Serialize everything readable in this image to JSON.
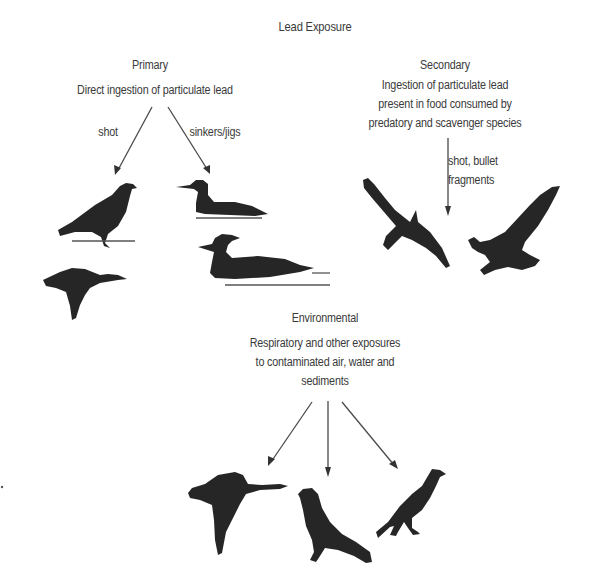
{
  "diagram": {
    "title": "Lead Exposure",
    "primary": {
      "heading": "Primary",
      "description": "Direct ingestion of particulate lead",
      "branches": [
        {
          "label": "shot"
        },
        {
          "label": "sinkers/jigs"
        }
      ],
      "birds": [
        "pigeon-standing",
        "duck-flying",
        "loon-swimming",
        "merganser-swimming"
      ]
    },
    "secondary": {
      "heading": "Secondary",
      "description_lines": [
        "Ingestion of particulate lead",
        "present in food consumed by",
        "predatory and scavenger species"
      ],
      "arrow_label_lines": [
        "shot, bullet",
        "fragments"
      ],
      "birds": [
        "eagle-soaring",
        "eagle-landing"
      ]
    },
    "environmental": {
      "heading": "Environmental",
      "description_lines": [
        "Respiratory and other exposures",
        "to contaminated air, water and",
        "sediments"
      ],
      "birds": [
        "goose-flying",
        "pigeon-standing",
        "crow-standing"
      ]
    }
  }
}
